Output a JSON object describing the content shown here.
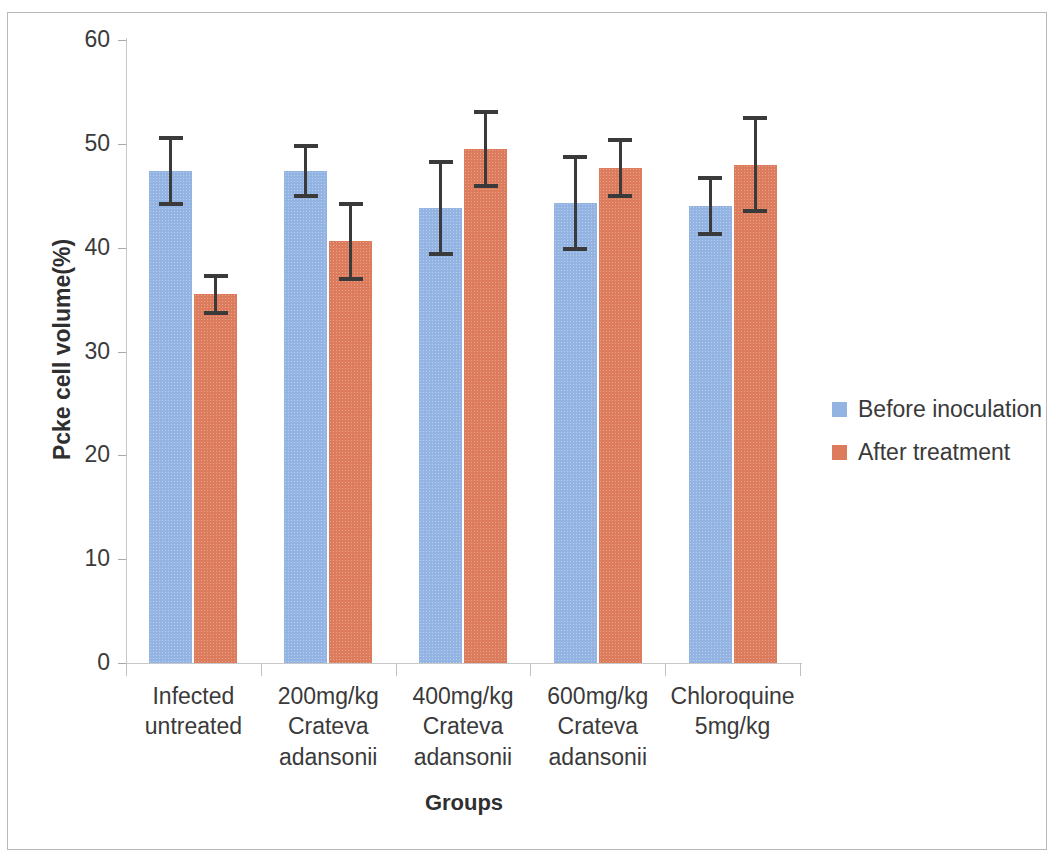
{
  "chart_data": {
    "type": "bar",
    "title": "",
    "xlabel": "Groups",
    "ylabel": "Pcke cell volume(%)",
    "ylim": [
      0,
      60
    ],
    "yticks": [
      0,
      10,
      20,
      30,
      40,
      50,
      60
    ],
    "ytick_labels": [
      "0",
      "10",
      "20",
      "30",
      "40",
      "50",
      "60"
    ],
    "grid": false,
    "legend_position": "right",
    "categories": [
      "Infected untreated",
      "200mg/kg Crateva adansonii",
      "400mg/kg Crateva adansonii",
      "600mg/kg Crateva adansonii",
      "Chloroquine 5mg/kg"
    ],
    "category_lines": [
      [
        "Infected",
        "untreated"
      ],
      [
        "200mg/kg",
        "Crateva",
        "adansonii"
      ],
      [
        "400mg/kg",
        "Crateva",
        "adansonii"
      ],
      [
        "600mg/kg",
        "Crateva",
        "adansonii"
      ],
      [
        "Chloroquine",
        "5mg/kg"
      ]
    ],
    "series": [
      {
        "name": "Before inoculation",
        "color": "#93b3e3",
        "values": [
          47.4,
          47.4,
          43.8,
          44.3,
          44.0
        ],
        "errors": [
          3.4,
          2.6,
          4.6,
          4.6,
          2.9
        ]
      },
      {
        "name": "After treatment",
        "color": "#dd7c5c",
        "values": [
          35.5,
          40.6,
          49.5,
          47.7,
          48.0
        ],
        "errors": [
          2.0,
          3.8,
          3.8,
          2.9,
          4.7
        ]
      }
    ]
  },
  "legend": {
    "items": [
      {
        "label": "Before inoculation",
        "color": "#93b3e3"
      },
      {
        "label": "After treatment",
        "color": "#dd7c5c"
      }
    ]
  },
  "axes": {
    "y_title": "Pcke cell volume(%)",
    "x_title": "Groups"
  }
}
